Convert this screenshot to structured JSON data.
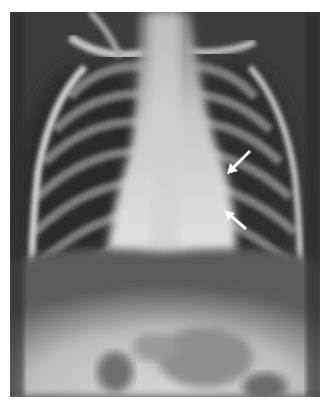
{
  "image": {
    "subject": "pediatric chest radiograph (frontal view)",
    "annotations": [
      {
        "type": "arrow",
        "direction": "down-left",
        "color": "#ffffff",
        "tip": [
          229,
          171
        ],
        "tail": [
          250,
          151
        ]
      },
      {
        "type": "arrow",
        "direction": "up-left",
        "color": "#ffffff",
        "tip": [
          228,
          213
        ],
        "tail": [
          246,
          229
        ]
      }
    ],
    "colors": {
      "border": "#ffffff",
      "background": "#3a3a3a",
      "bone": "#e0e0e0",
      "lung": "#2e2e2e"
    }
  }
}
